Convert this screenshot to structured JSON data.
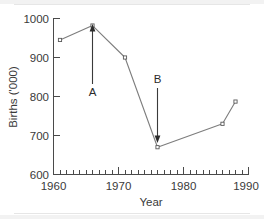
{
  "chart_data": {
    "type": "line",
    "title": "",
    "xlabel": "Year",
    "ylabel": "Births ('000)",
    "xlim": [
      1960,
      1990
    ],
    "ylim": [
      600,
      1000
    ],
    "x_major_ticks": [
      1960,
      1970,
      1980,
      1990
    ],
    "x_major_tick_labels": [
      "1960",
      "1970",
      "1980",
      "1990"
    ],
    "x_minor_tick_step": 1,
    "y_major_ticks": [
      600,
      700,
      800,
      900,
      1000
    ],
    "y_major_tick_labels": [
      "600",
      "700",
      "800",
      "900",
      "1000"
    ],
    "grid": false,
    "legend": null,
    "series": [
      {
        "name": "Births",
        "x": [
          1961,
          1966,
          1971,
          1976,
          1986,
          1988
        ],
        "values": [
          945,
          982,
          900,
          670,
          730,
          787
        ],
        "marker": "square",
        "color": "#7d7d7d"
      }
    ],
    "annotations": [
      {
        "label": "A",
        "x": 1966,
        "points_to_value": 975,
        "label_at_value": 845,
        "direction": "up"
      },
      {
        "label": "B",
        "x": 1976,
        "points_to_value": 700,
        "label_at_value": 860,
        "direction": "down"
      }
    ]
  },
  "axes": {
    "y_labels": [
      "1000",
      "900",
      "800",
      "700",
      "600"
    ],
    "x_labels": [
      "1960",
      "1970",
      "1980",
      "1990"
    ],
    "x_title": "Year",
    "y_title": "Births ('000)"
  },
  "annotations": {
    "a_label": "A",
    "b_label": "B"
  },
  "colors": {
    "line": "#7d7d7d",
    "axis": "#4a4a4a",
    "text": "#3a3a3a",
    "annotation": "#2b2b2b",
    "background": "#ffffff"
  }
}
